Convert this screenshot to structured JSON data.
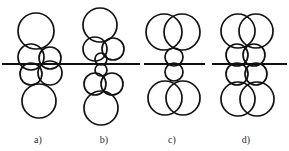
{
  "figure": {
    "background_color": "#ffffff",
    "stroke_color": "#111111",
    "label_color": "#2b2b2b",
    "captions": [
      {
        "id": "a",
        "text": "a)",
        "x": 38,
        "y": 143
      },
      {
        "id": "b",
        "text": "b)",
        "x": 104,
        "y": 143
      },
      {
        "id": "c",
        "text": "c)",
        "x": 172,
        "y": 143
      },
      {
        "id": "d",
        "text": "d)",
        "x": 246,
        "y": 143
      }
    ],
    "axis_lines": [
      {
        "id": "axis-a",
        "x1": 2,
        "y1": 64,
        "x2": 72,
        "y2": 64,
        "width": 1.8
      },
      {
        "id": "axis-b",
        "x1": 72,
        "y1": 64,
        "x2": 140,
        "y2": 64,
        "width": 1.8
      },
      {
        "id": "axis-c",
        "x1": 144,
        "y1": 64,
        "x2": 205,
        "y2": 64,
        "width": 1.8
      },
      {
        "id": "axis-d",
        "x1": 212,
        "y1": 64,
        "x2": 287,
        "y2": 64,
        "width": 1.8
      }
    ],
    "panels": [
      {
        "id": "a",
        "label": "a)",
        "circles": [
          {
            "cx": 36,
            "cy": 31,
            "r": 18,
            "w": 1.7
          },
          {
            "cx": 31,
            "cy": 57,
            "r": 13,
            "w": 1.7
          },
          {
            "cx": 50,
            "cy": 58,
            "r": 11,
            "w": 1.7
          },
          {
            "cx": 31,
            "cy": 74,
            "r": 11,
            "w": 1.7
          },
          {
            "cx": 50,
            "cy": 73,
            "r": 12,
            "w": 1.7
          },
          {
            "cx": 39,
            "cy": 101,
            "r": 17,
            "w": 1.7
          }
        ]
      },
      {
        "id": "b",
        "label": "b)",
        "circles": [
          {
            "cx": 100,
            "cy": 25,
            "r": 17,
            "w": 1.7
          },
          {
            "cx": 95,
            "cy": 49,
            "r": 12,
            "w": 1.7
          },
          {
            "cx": 113,
            "cy": 49,
            "r": 11,
            "w": 1.7
          },
          {
            "cx": 101,
            "cy": 59,
            "r": 6,
            "w": 1.7
          },
          {
            "cx": 101,
            "cy": 70,
            "r": 6,
            "w": 1.7
          },
          {
            "cx": 95,
            "cy": 84,
            "r": 11,
            "w": 1.7
          },
          {
            "cx": 112,
            "cy": 84,
            "r": 11,
            "w": 1.7
          },
          {
            "cx": 101,
            "cy": 108,
            "r": 17,
            "w": 1.7
          }
        ]
      },
      {
        "id": "c",
        "label": "c)",
        "circles": [
          {
            "cx": 164,
            "cy": 32,
            "r": 18,
            "w": 1.7
          },
          {
            "cx": 182,
            "cy": 32,
            "r": 18,
            "w": 1.7
          },
          {
            "cx": 174,
            "cy": 57,
            "r": 9,
            "w": 1.7
          },
          {
            "cx": 174,
            "cy": 72,
            "r": 9,
            "w": 1.7
          },
          {
            "cx": 165,
            "cy": 98,
            "r": 17,
            "w": 1.7
          },
          {
            "cx": 183,
            "cy": 98,
            "r": 17,
            "w": 1.7
          }
        ]
      },
      {
        "id": "d",
        "label": "d)",
        "circles": [
          {
            "cx": 238,
            "cy": 31,
            "r": 17,
            "w": 1.7
          },
          {
            "cx": 256,
            "cy": 31,
            "r": 17,
            "w": 1.7
          },
          {
            "cx": 237,
            "cy": 55,
            "r": 11,
            "w": 1.7
          },
          {
            "cx": 254,
            "cy": 55,
            "r": 11,
            "w": 1.7
          },
          {
            "cx": 237,
            "cy": 74,
            "r": 11,
            "w": 1.7
          },
          {
            "cx": 256,
            "cy": 74,
            "r": 11,
            "w": 1.7
          },
          {
            "cx": 238,
            "cy": 99,
            "r": 17,
            "w": 1.7
          },
          {
            "cx": 257,
            "cy": 99,
            "r": 17,
            "w": 1.7
          }
        ]
      }
    ]
  }
}
